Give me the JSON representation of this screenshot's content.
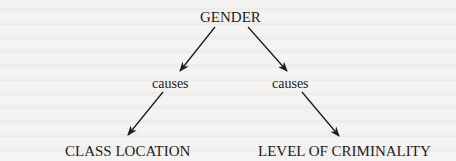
{
  "diagram": {
    "type": "causal-flow",
    "nodes": {
      "root": {
        "label": "GENDER"
      },
      "link_left": {
        "label": "causes"
      },
      "link_right": {
        "label": "causes"
      },
      "outcome_left": {
        "label": "CLASS LOCATION"
      },
      "outcome_right": {
        "label": "LEVEL OF CRIMINALITY"
      }
    },
    "edges": [
      {
        "from": "GENDER",
        "to": "causes (left)"
      },
      {
        "from": "GENDER",
        "to": "causes (right)"
      },
      {
        "from": "causes (left)",
        "to": "CLASS LOCATION"
      },
      {
        "from": "causes (right)",
        "to": "LEVEL OF CRIMINALITY"
      }
    ],
    "colors": {
      "ink": "#1c1c1c",
      "paper": "#f4f3f1"
    }
  }
}
